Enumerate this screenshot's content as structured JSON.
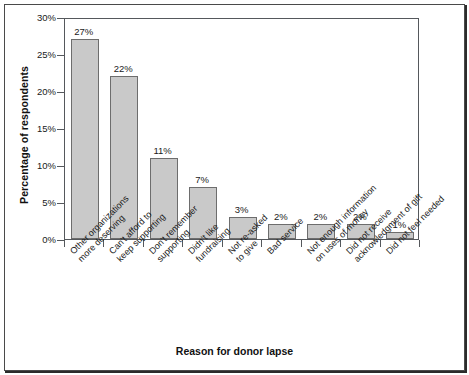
{
  "chart_data": {
    "type": "bar",
    "title": "",
    "xlabel": "Reason for donor lapse",
    "ylabel": "Percentage of respondents",
    "ylim": [
      0,
      30
    ],
    "ytick_labels": [
      "0%",
      "5%",
      "10%",
      "15%",
      "20%",
      "25%",
      "30%"
    ],
    "ytick_values": [
      0,
      5,
      10,
      15,
      20,
      25,
      30
    ],
    "grid": false,
    "legend": "none",
    "bar_color": "#c9c9c9",
    "bar_edge_color": "#6d6d6d",
    "categories": [
      "Other organizations more deserving",
      "Can't afford to keep supporting",
      "Don't remember supporting",
      "Didn't like fundraising",
      "Not re-asked to give",
      "Bad service",
      "Not enough information on uses of money",
      "Did not receive acknowledgment of gift",
      "Did not feel needed"
    ],
    "category_lines": [
      [
        "Other organizations",
        "more deserving"
      ],
      [
        "Can't afford to",
        "keep supporting"
      ],
      [
        "Don't remember",
        "supporting"
      ],
      [
        "Didn't like",
        "fundraising"
      ],
      [
        "Not re-asked",
        "to give"
      ],
      [
        "Bad service"
      ],
      [
        "Not enough information",
        "on uses of money"
      ],
      [
        "Did not receive",
        "acknowledgment of gift"
      ],
      [
        "Did not feel needed"
      ]
    ],
    "values": [
      27,
      22,
      11,
      7,
      3,
      2,
      2,
      2,
      1
    ],
    "value_labels": [
      "27%",
      "22%",
      "11%",
      "7%",
      "3%",
      "2%",
      "2%",
      "2%",
      "1%"
    ]
  }
}
